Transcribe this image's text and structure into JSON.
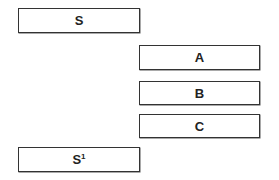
{
  "diagram": {
    "boxes": [
      {
        "id": "S",
        "label": "S"
      },
      {
        "id": "A",
        "label": "A"
      },
      {
        "id": "B",
        "label": "B"
      },
      {
        "id": "C",
        "label": "C"
      },
      {
        "id": "S1",
        "label": "S",
        "superscript": "1"
      }
    ]
  }
}
